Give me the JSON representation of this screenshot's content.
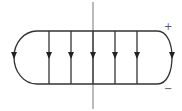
{
  "diagram": {
    "labels": {
      "positive": "+",
      "negative": "−"
    },
    "colors": {
      "stroke": "#333333",
      "axis": "#777777"
    },
    "field_lines_x": [
      49,
      71,
      93,
      115,
      137
    ],
    "arrow_direction": "down"
  }
}
